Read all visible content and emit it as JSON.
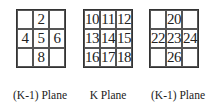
{
  "planes": [
    {
      "label": "(K-1) Plane",
      "cells": [
        "",
        "2",
        "",
        "4",
        "5",
        "6",
        "",
        "8",
        ""
      ]
    },
    {
      "label": "K Plane",
      "cells": [
        "10",
        "11",
        "12",
        "13",
        "14",
        "15",
        "16",
        "17",
        "18"
      ]
    },
    {
      "label": "(K-1) Plane",
      "cells": [
        "",
        "20",
        "",
        "22",
        "23",
        "24",
        "",
        "26",
        ""
      ]
    }
  ]
}
